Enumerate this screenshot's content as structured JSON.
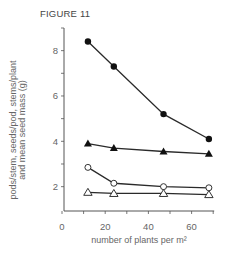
{
  "figure": {
    "title": "FIGURE 11"
  },
  "chart_data": {
    "type": "line",
    "title": "FIGURE 11",
    "xlabel": "number of plants per m²",
    "ylabel_line1": "pods/stem, seeds/pod, stems/plant",
    "ylabel_line2": "and mean seed mass (g)",
    "xlim": [
      0,
      70
    ],
    "ylim": [
      1,
      9
    ],
    "xticks": [
      0,
      10,
      20,
      30,
      40,
      50,
      60,
      70
    ],
    "xtick_labels": [
      "0",
      "",
      "20",
      "",
      "40",
      "",
      "60",
      ""
    ],
    "yticks": [
      2,
      3,
      4,
      5,
      6,
      7,
      8
    ],
    "ytick_labels": [
      "2",
      "",
      "4",
      "",
      "6",
      "",
      "8"
    ],
    "grid": false,
    "legend": null,
    "x": [
      12,
      24,
      47,
      68
    ],
    "series": [
      {
        "name": "filled circles",
        "marker": "circle-filled",
        "values": [
          8.4,
          7.3,
          5.2,
          4.1
        ]
      },
      {
        "name": "filled triangles",
        "marker": "triangle-filled",
        "values": [
          3.9,
          3.7,
          3.55,
          3.45
        ]
      },
      {
        "name": "open circles",
        "marker": "circle-open",
        "values": [
          2.85,
          2.15,
          2.0,
          1.95
        ]
      },
      {
        "name": "open triangles",
        "marker": "triangle-open",
        "values": [
          1.75,
          1.7,
          1.7,
          1.65
        ]
      }
    ]
  },
  "colors": {
    "line": "#2a2a2a",
    "axis": "#555555",
    "text": "#666666"
  }
}
